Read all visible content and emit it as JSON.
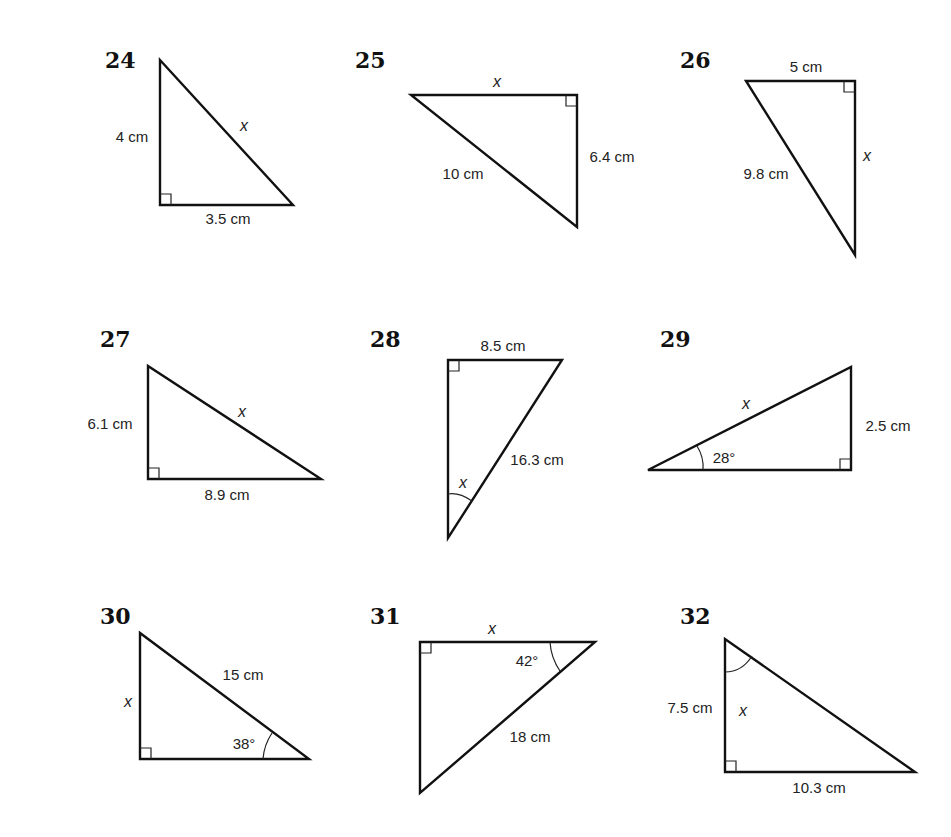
{
  "problems": [
    {
      "number": "24",
      "number_pos": [
        105,
        68
      ],
      "vertices": [
        [
          160,
          60
        ],
        [
          160,
          205
        ],
        [
          293,
          205
        ]
      ],
      "right_angle": {
        "at": [
          160,
          205
        ],
        "dx": 1,
        "dy": -1
      },
      "labels": [
        {
          "text": "4 cm",
          "pos": [
            132,
            142
          ],
          "anchor": "middle",
          "kind": "lbl"
        },
        {
          "text": "x",
          "pos": [
            244,
            131
          ],
          "anchor": "middle",
          "kind": "var"
        },
        {
          "text": "3.5 cm",
          "pos": [
            228,
            224
          ],
          "anchor": "middle",
          "kind": "lbl"
        }
      ],
      "arc": null
    },
    {
      "number": "25",
      "number_pos": [
        355,
        68
      ],
      "vertices": [
        [
          411,
          95
        ],
        [
          577,
          95
        ],
        [
          577,
          227
        ]
      ],
      "right_angle": {
        "at": [
          577,
          95
        ],
        "dx": -1,
        "dy": 1
      },
      "labels": [
        {
          "text": "x",
          "pos": [
            497,
            87
          ],
          "anchor": "middle",
          "kind": "var"
        },
        {
          "text": "6.4 cm",
          "pos": [
            612,
            162
          ],
          "anchor": "middle",
          "kind": "lbl"
        },
        {
          "text": "10 cm",
          "pos": [
            463,
            179
          ],
          "anchor": "middle",
          "kind": "lbl"
        }
      ],
      "arc": null
    },
    {
      "number": "26",
      "number_pos": [
        680,
        68
      ],
      "vertices": [
        [
          746,
          81
        ],
        [
          855,
          81
        ],
        [
          855,
          255
        ]
      ],
      "right_angle": {
        "at": [
          855,
          81
        ],
        "dx": -1,
        "dy": 1
      },
      "labels": [
        {
          "text": "5 cm",
          "pos": [
            806,
            72
          ],
          "anchor": "middle",
          "kind": "lbl"
        },
        {
          "text": "x",
          "pos": [
            867,
            161
          ],
          "anchor": "middle",
          "kind": "var"
        },
        {
          "text": "9.8 cm",
          "pos": [
            766,
            179
          ],
          "anchor": "middle",
          "kind": "lbl"
        }
      ],
      "arc": null
    },
    {
      "number": "27",
      "number_pos": [
        100,
        347
      ],
      "vertices": [
        [
          148,
          366
        ],
        [
          148,
          479
        ],
        [
          321,
          479
        ]
      ],
      "right_angle": {
        "at": [
          148,
          479
        ],
        "dx": 1,
        "dy": -1
      },
      "labels": [
        {
          "text": "6.1 cm",
          "pos": [
            110,
            429
          ],
          "anchor": "middle",
          "kind": "lbl"
        },
        {
          "text": "x",
          "pos": [
            242,
            417
          ],
          "anchor": "middle",
          "kind": "var"
        },
        {
          "text": "8.9 cm",
          "pos": [
            227,
            500
          ],
          "anchor": "middle",
          "kind": "lbl"
        }
      ],
      "arc": null
    },
    {
      "number": "28",
      "number_pos": [
        370,
        347
      ],
      "vertices": [
        [
          448,
          360
        ],
        [
          562,
          360
        ],
        [
          448,
          538
        ]
      ],
      "right_angle": {
        "at": [
          448,
          360
        ],
        "dx": 1,
        "dy": 1
      },
      "labels": [
        {
          "text": "8.5 cm",
          "pos": [
            503,
            351
          ],
          "anchor": "middle",
          "kind": "lbl"
        },
        {
          "text": "16.3 cm",
          "pos": [
            537,
            465
          ],
          "anchor": "middle",
          "kind": "lbl"
        },
        {
          "text": "x",
          "pos": [
            463,
            488
          ],
          "anchor": "middle",
          "kind": "var"
        }
      ],
      "arc": {
        "d": "M 448 494 Q 459 492 472 501"
      }
    },
    {
      "number": "29",
      "number_pos": [
        660,
        347
      ],
      "vertices": [
        [
          648,
          470
        ],
        [
          851,
          470
        ],
        [
          851,
          367
        ]
      ],
      "right_angle": {
        "at": [
          851,
          470
        ],
        "dx": -1,
        "dy": -1
      },
      "labels": [
        {
          "text": "x",
          "pos": [
            746,
            409
          ],
          "anchor": "middle",
          "kind": "var"
        },
        {
          "text": "2.5 cm",
          "pos": [
            888,
            431
          ],
          "anchor": "middle",
          "kind": "lbl"
        },
        {
          "text": "28°",
          "pos": [
            724,
            463
          ],
          "anchor": "middle",
          "kind": "lbl"
        }
      ],
      "arc": {
        "d": "M 697 446 Q 704 457 703 470"
      }
    },
    {
      "number": "30",
      "number_pos": [
        100,
        624
      ],
      "vertices": [
        [
          140,
          633
        ],
        [
          140,
          759
        ],
        [
          309,
          759
        ]
      ],
      "right_angle": {
        "at": [
          140,
          759
        ],
        "dx": 1,
        "dy": -1
      },
      "labels": [
        {
          "text": "15 cm",
          "pos": [
            243,
            680
          ],
          "anchor": "middle",
          "kind": "lbl"
        },
        {
          "text": "x",
          "pos": [
            128,
            707
          ],
          "anchor": "middle",
          "kind": "var"
        },
        {
          "text": "38°",
          "pos": [
            244,
            749
          ],
          "anchor": "middle",
          "kind": "lbl"
        }
      ],
      "arc": {
        "d": "M 272 733 Q 264 745 263 759"
      }
    },
    {
      "number": "31",
      "number_pos": [
        370,
        624
      ],
      "vertices": [
        [
          420,
          642
        ],
        [
          595,
          642
        ],
        [
          420,
          793
        ]
      ],
      "right_angle": {
        "at": [
          420,
          642
        ],
        "dx": 1,
        "dy": 1
      },
      "labels": [
        {
          "text": "x",
          "pos": [
            492,
            634
          ],
          "anchor": "middle",
          "kind": "var"
        },
        {
          "text": "42°",
          "pos": [
            527,
            666
          ],
          "anchor": "middle",
          "kind": "lbl"
        },
        {
          "text": "18 cm",
          "pos": [
            530,
            742
          ],
          "anchor": "middle",
          "kind": "lbl"
        }
      ],
      "arc": {
        "d": "M 550 642 Q 551 658 560 671"
      }
    },
    {
      "number": "32",
      "number_pos": [
        680,
        624
      ],
      "vertices": [
        [
          725,
          639
        ],
        [
          725,
          772
        ],
        [
          915,
          772
        ]
      ],
      "right_angle": {
        "at": [
          725,
          772
        ],
        "dx": 1,
        "dy": -1
      },
      "labels": [
        {
          "text": "x",
          "pos": [
            743,
            716
          ],
          "anchor": "middle",
          "kind": "var"
        },
        {
          "text": "7.5 cm",
          "pos": [
            690,
            713
          ],
          "anchor": "middle",
          "kind": "lbl"
        },
        {
          "text": "10.3 cm",
          "pos": [
            819,
            793
          ],
          "anchor": "middle",
          "kind": "lbl"
        }
      ],
      "arc": {
        "d": "M 725 672 Q 742 672 752 656"
      }
    }
  ]
}
